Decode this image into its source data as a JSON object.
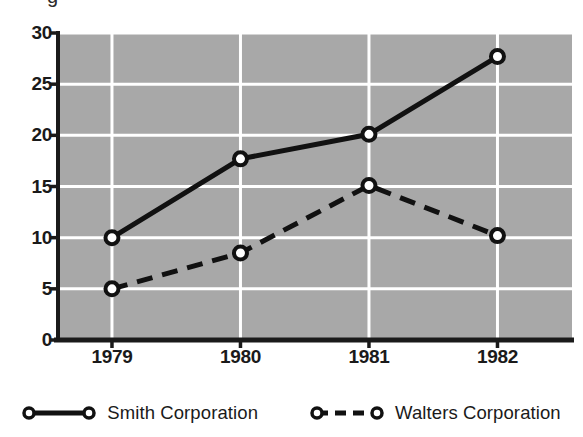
{
  "figure": {
    "clipped_top_glyph": "g",
    "background_color": "#ffffff",
    "plot_background_color": "#a8a8a8",
    "gridline_color": "#ffffff",
    "axis_color": "#1a1a1a",
    "series_color": "#111111"
  },
  "axes": {
    "y_ticks": [
      "0",
      "5",
      "10",
      "15",
      "20",
      "25",
      "30"
    ],
    "x_ticks": [
      "1979",
      "1980",
      "1981",
      "1982"
    ]
  },
  "legend": {
    "position": "bottom-center",
    "items": [
      {
        "label": "Smith Corporation",
        "style": "solid",
        "marker": "open-circle"
      },
      {
        "label": "Walters Corporation",
        "style": "dashed",
        "marker": "open-circle"
      }
    ]
  },
  "chart_data": {
    "type": "line",
    "title": "",
    "xlabel": "",
    "ylabel": "",
    "categories": [
      "1979",
      "1980",
      "1981",
      "1982"
    ],
    "ylim": [
      0,
      30
    ],
    "yticks": [
      0,
      5,
      10,
      15,
      20,
      25,
      30
    ],
    "grid": true,
    "legend_position": "bottom-center",
    "series": [
      {
        "name": "Smith Corporation",
        "values": [
          10,
          17.7,
          20.1,
          27.7
        ],
        "style": "solid",
        "marker": "open-circle",
        "color": "#111111",
        "line_width": 5
      },
      {
        "name": "Walters Corporation",
        "values": [
          5,
          8.5,
          15.1,
          10.2
        ],
        "style": "dashed",
        "marker": "open-circle",
        "color": "#111111",
        "line_width": 5
      }
    ]
  }
}
